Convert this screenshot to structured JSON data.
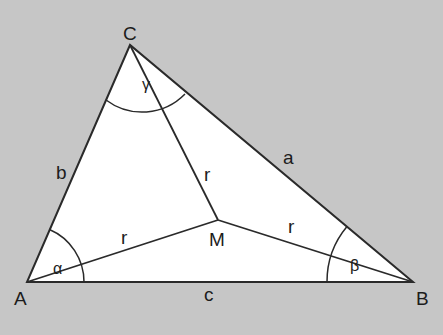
{
  "diagram": {
    "colors": {
      "background": "#c6c6c6",
      "triangle_fill": "#ffffff",
      "stroke": "#2a2a2a",
      "text": "#1c1c1c"
    },
    "vertices": {
      "A": {
        "label": "A",
        "x": 27,
        "y": 282
      },
      "B": {
        "label": "B",
        "x": 413,
        "y": 282
      },
      "C": {
        "label": "C",
        "x": 130,
        "y": 45
      },
      "M": {
        "label": "M",
        "x": 218,
        "y": 220
      }
    },
    "sides": {
      "a": "a",
      "b": "b",
      "c": "c"
    },
    "segments": {
      "r_top": "r",
      "r_left": "r",
      "r_right": "r"
    },
    "angles": {
      "alpha": "α",
      "beta": "β",
      "gamma": "γ"
    }
  }
}
